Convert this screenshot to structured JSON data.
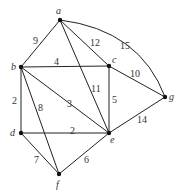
{
  "diagram": {
    "type": "weighted-graph",
    "nodes": [
      {
        "id": "a",
        "label": "a",
        "x": 60,
        "y": 20,
        "lx": 56,
        "ly": 14
      },
      {
        "id": "b",
        "label": "b",
        "x": 21,
        "y": 67,
        "lx": 11,
        "ly": 70
      },
      {
        "id": "c",
        "label": "c",
        "x": 109,
        "y": 66,
        "lx": 112,
        "ly": 63
      },
      {
        "id": "d",
        "label": "d",
        "x": 21,
        "y": 133,
        "lx": 10,
        "ly": 136
      },
      {
        "id": "e",
        "label": "e",
        "x": 109,
        "y": 133,
        "lx": 110,
        "ly": 143
      },
      {
        "id": "f",
        "label": "f",
        "x": 59,
        "y": 174,
        "lx": 56,
        "ly": 188
      },
      {
        "id": "g",
        "label": "g",
        "x": 165,
        "y": 97,
        "lx": 169,
        "ly": 100
      }
    ],
    "edges": [
      {
        "from": "a",
        "to": "b",
        "weight": "9",
        "lx": 33,
        "ly": 44
      },
      {
        "from": "a",
        "to": "c",
        "weight": "12",
        "lx": 90,
        "ly": 46
      },
      {
        "from": "a",
        "to": "g",
        "weight": "15",
        "lx": 120,
        "ly": 49,
        "curved": true
      },
      {
        "from": "a",
        "to": "e",
        "weight": "11",
        "lx": 91,
        "ly": 92
      },
      {
        "from": "b",
        "to": "c",
        "weight": "4",
        "lx": 54,
        "ly": 65
      },
      {
        "from": "b",
        "to": "e",
        "weight": "3",
        "lx": 67,
        "ly": 107
      },
      {
        "from": "b",
        "to": "d",
        "weight": "2",
        "lx": 12,
        "ly": 104
      },
      {
        "from": "b",
        "to": "f",
        "weight": "8",
        "lx": 38,
        "ly": 111
      },
      {
        "from": "c",
        "to": "e",
        "weight": "5",
        "lx": 112,
        "ly": 103
      },
      {
        "from": "c",
        "to": "g",
        "weight": "10",
        "lx": 130,
        "ly": 77
      },
      {
        "from": "d",
        "to": "e",
        "weight": "2",
        "lx": 70,
        "ly": 134
      },
      {
        "from": "d",
        "to": "f",
        "weight": "7",
        "lx": 34,
        "ly": 163
      },
      {
        "from": "f",
        "to": "e",
        "weight": "6",
        "lx": 84,
        "ly": 163
      },
      {
        "from": "e",
        "to": "g",
        "weight": "14",
        "lx": 137,
        "ly": 123
      }
    ]
  }
}
